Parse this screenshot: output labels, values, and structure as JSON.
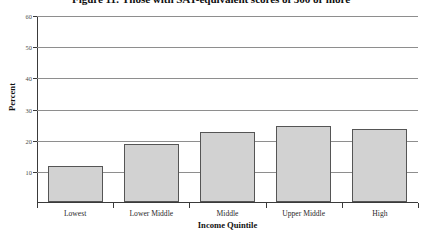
{
  "chart_data": {
    "type": "bar",
    "title": "Figure 11: Those with SAT-equivalent scores of 500 or more",
    "xlabel": "Income Quintile",
    "ylabel": "Percent",
    "categories": [
      "Lowest",
      "Lower Middle",
      "Middle",
      "Upper Middle",
      "High"
    ],
    "values": [
      11.5,
      18.5,
      22.5,
      24.5,
      23.5
    ],
    "ylim": [
      0,
      60
    ],
    "yticks": [
      10,
      20,
      30,
      40,
      50,
      60
    ],
    "ytick_labels": [
      "10",
      "20",
      "30",
      "40",
      "50",
      "60"
    ],
    "grid": true,
    "legend": "none",
    "bar_fill_color": "#d2d2d2",
    "bar_edge_color": "#555555",
    "gridline_color": "#8e8e8e",
    "axis_color": "#3a3a3a"
  }
}
